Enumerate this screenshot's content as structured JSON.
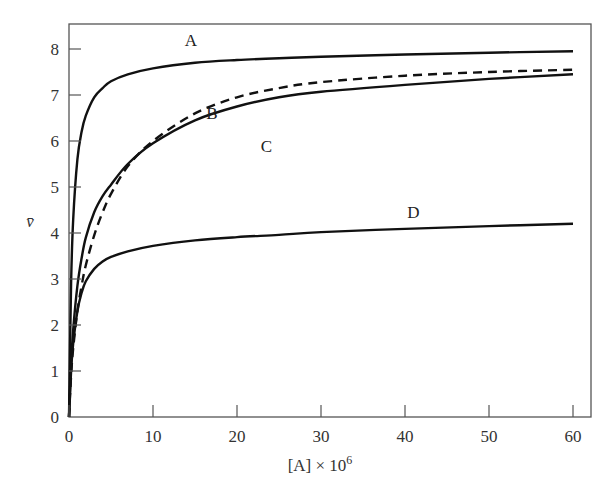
{
  "chart_data": {
    "type": "line",
    "title": "",
    "xlabel": "[A] × 10^6",
    "ylabel": "v̄",
    "xlim": [
      0,
      62
    ],
    "ylim": [
      0,
      8.6
    ],
    "xticks": [
      0,
      10,
      20,
      30,
      40,
      50,
      60
    ],
    "yticks": [
      0,
      1,
      2,
      3,
      4,
      5,
      6,
      7,
      8
    ],
    "grid": false,
    "legend": "inline curve labels",
    "x": [
      0,
      0.25,
      0.5,
      1,
      1.5,
      2,
      3,
      4,
      5,
      7,
      10,
      15,
      20,
      25,
      30,
      40,
      50,
      60
    ],
    "series": [
      {
        "name": "A",
        "style": "solid",
        "values": [
          0,
          2.9,
          4.3,
          5.6,
          6.2,
          6.55,
          6.95,
          7.15,
          7.3,
          7.45,
          7.58,
          7.7,
          7.76,
          7.8,
          7.83,
          7.88,
          7.92,
          7.95
        ],
        "label_pos": [
          14.5,
          8.2
        ]
      },
      {
        "name": "B",
        "style": "dashed",
        "values": [
          0,
          0.9,
          1.5,
          2.3,
          2.85,
          3.3,
          3.95,
          4.45,
          4.85,
          5.45,
          6.0,
          6.6,
          6.95,
          7.15,
          7.28,
          7.42,
          7.5,
          7.55
        ],
        "label_pos": [
          17,
          6.6
        ]
      },
      {
        "name": "C",
        "style": "solid",
        "values": [
          0,
          1.15,
          1.9,
          2.85,
          3.45,
          3.9,
          4.45,
          4.8,
          5.05,
          5.5,
          5.95,
          6.45,
          6.75,
          6.95,
          7.07,
          7.22,
          7.35,
          7.45
        ],
        "label_pos": [
          23.5,
          5.9
        ]
      },
      {
        "name": "D",
        "style": "solid",
        "values": [
          0,
          1.0,
          1.6,
          2.3,
          2.7,
          2.95,
          3.22,
          3.38,
          3.48,
          3.6,
          3.72,
          3.84,
          3.91,
          3.96,
          4.02,
          4.09,
          4.15,
          4.2
        ],
        "label_pos": [
          41,
          4.45
        ]
      }
    ]
  }
}
